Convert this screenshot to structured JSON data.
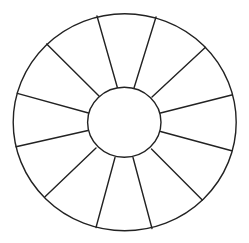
{
  "diagram": {
    "type": "segmented-wheel",
    "segment_count": 12,
    "stroke_color": "#222222",
    "fill_color": "#ffffff",
    "background_color": "#ffffff",
    "stroke_width": 1.4,
    "outer_ellipse": {
      "cx": 124.7,
      "cy": 122.2,
      "rx": 111.5,
      "ry": 108.5
    },
    "inner_ellipse": {
      "cx": 124.3,
      "cy": 122.3,
      "rx": 36.7,
      "ry": 35.0
    },
    "spokes": [
      {
        "x1": 97,
        "y1": 16,
        "x2": 117.5,
        "y2": 88
      },
      {
        "x1": 156,
        "y1": 17,
        "x2": 134,
        "y2": 88
      },
      {
        "x1": 205.5,
        "y1": 47.3,
        "x2": 152,
        "y2": 97
      },
      {
        "x1": 231.7,
        "y1": 95,
        "x2": 160.5,
        "y2": 113
      },
      {
        "x1": 231.7,
        "y1": 150.7,
        "x2": 160.5,
        "y2": 131.5
      },
      {
        "x1": 202.3,
        "y1": 200,
        "x2": 151.5,
        "y2": 149
      },
      {
        "x1": 152,
        "y1": 228.5,
        "x2": 133,
        "y2": 157.5
      },
      {
        "x1": 96,
        "y1": 227.5,
        "x2": 115,
        "y2": 157.5
      },
      {
        "x1": 45,
        "y1": 196.7,
        "x2": 96,
        "y2": 148
      },
      {
        "x1": 16,
        "y1": 146.7,
        "x2": 88,
        "y2": 130.5
      },
      {
        "x1": 17.3,
        "y1": 93.3,
        "x2": 88.5,
        "y2": 113
      },
      {
        "x1": 46.7,
        "y1": 44,
        "x2": 99,
        "y2": 96
      }
    ]
  }
}
